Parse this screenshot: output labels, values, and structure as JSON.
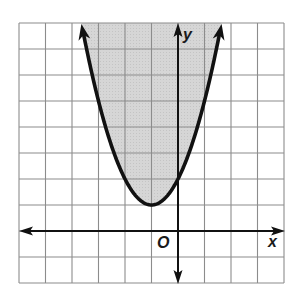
{
  "chart_data": {
    "type": "line",
    "title": "",
    "xlabel": "x",
    "ylabel": "y",
    "origin_label": "O",
    "xlim": [
      -6,
      4
    ],
    "ylim": [
      -2,
      8
    ],
    "grid": true,
    "grid_step": 1,
    "boundary": {
      "equation": "y = (x + 1)^2 + 1",
      "style": "solid",
      "vertex": [
        -1,
        1
      ],
      "y_intercept": [
        0,
        2
      ],
      "points": [
        [
          -3.65,
          8
        ],
        [
          -3,
          5
        ],
        [
          -2,
          2
        ],
        [
          -1,
          1
        ],
        [
          0,
          2
        ],
        [
          1,
          5
        ],
        [
          1.65,
          8
        ]
      ]
    },
    "shaded_region": "inside parabola (y >= (x+1)^2 + 1)",
    "colors": {
      "grid": "#8c8c8c",
      "shade": "#d4d4d4",
      "curve": "#111111",
      "axes": "#111111"
    }
  },
  "labels": {
    "x_axis": "x",
    "y_axis": "y",
    "origin": "O"
  }
}
